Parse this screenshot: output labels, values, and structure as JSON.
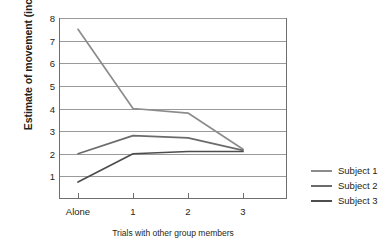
{
  "chart_data": {
    "type": "line",
    "title": "",
    "xlabel": "Trials with other group members",
    "ylabel": "Estimate of movement (inches)",
    "categories": [
      "Alone",
      "1",
      "2",
      "3"
    ],
    "xtick_labels": [
      "Alone",
      "1",
      "2",
      "3"
    ],
    "ytick_labels": [
      "1",
      "2",
      "3",
      "4",
      "5",
      "6",
      "7",
      "8"
    ],
    "ylim": [
      0,
      8
    ],
    "yticks": [
      1,
      2,
      3,
      4,
      5,
      6,
      7,
      8
    ],
    "grid": "horizontal",
    "legend_position": "right",
    "series": [
      {
        "name": "Subject 1",
        "color": "#8c8c8c",
        "values": [
          7.5,
          4.0,
          3.8,
          2.2
        ]
      },
      {
        "name": "Subject 2",
        "color": "#6b6b6b",
        "values": [
          2.0,
          2.8,
          2.7,
          2.15
        ]
      },
      {
        "name": "Subject 3",
        "color": "#4d4d4d",
        "values": [
          0.75,
          2.0,
          2.1,
          2.1
        ]
      }
    ]
  },
  "legend": {
    "items": [
      {
        "label": "Subject 1",
        "color": "#8c8c8c"
      },
      {
        "label": "Subject 2",
        "color": "#6b6b6b"
      },
      {
        "label": "Subject 3",
        "color": "#4d4d4d"
      }
    ]
  },
  "colors": {
    "gridline": "#9a9a9a",
    "axis": "#6f6f6f",
    "text": "#231f20",
    "background": "#ffffff"
  }
}
